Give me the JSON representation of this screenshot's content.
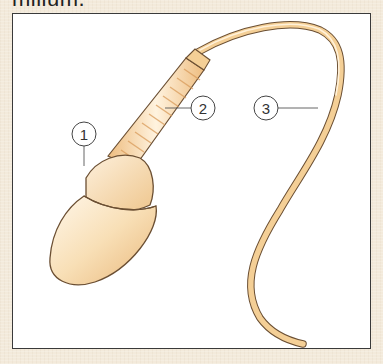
{
  "header": {
    "partial_title": "milium."
  },
  "diagram": {
    "colors": {
      "background": "#f3eadb",
      "frame_fill": "#ffffff",
      "frame_border": "#3a3a3a",
      "cell_fill": "#f6d9a8",
      "cell_highlight": "#fff6e6",
      "outline": "#6b4f33",
      "leader_line": "#555555"
    },
    "labels": [
      {
        "id": "1",
        "text": "1",
        "part": "head"
      },
      {
        "id": "2",
        "text": "2",
        "part": "midpiece"
      },
      {
        "id": "3",
        "text": "3",
        "part": "tail"
      }
    ]
  }
}
